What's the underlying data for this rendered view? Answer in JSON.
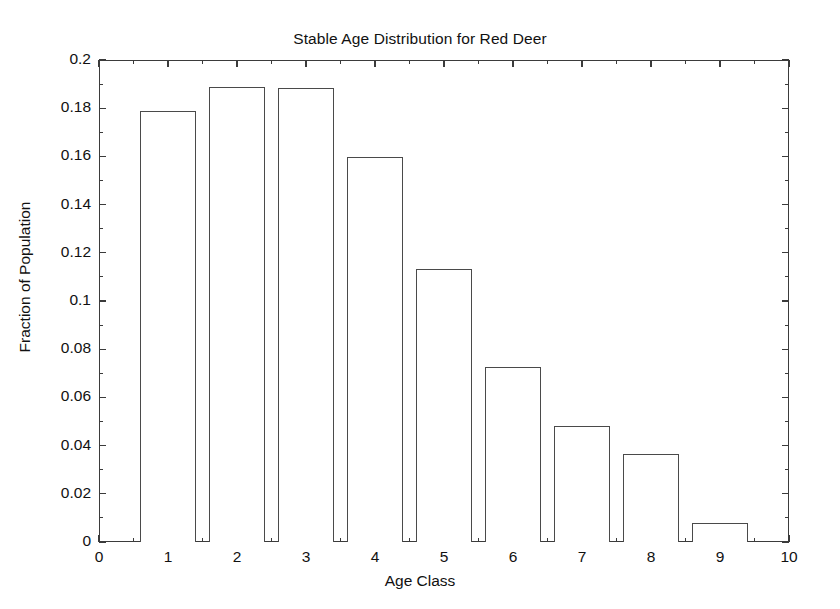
{
  "chart_data": {
    "type": "bar",
    "title": "Stable Age Distribution for Red Deer",
    "xlabel": "Age Class",
    "ylabel": "Fraction of Population",
    "categories": [
      "1",
      "2",
      "3",
      "4",
      "5",
      "6",
      "7",
      "8",
      "9"
    ],
    "x": [
      1,
      2,
      3,
      4,
      5,
      6,
      7,
      8,
      9
    ],
    "values": [
      0.179,
      0.189,
      0.1885,
      0.1597,
      0.1132,
      0.0728,
      0.0481,
      0.0366,
      0.0079
    ],
    "xlim": [
      0,
      10
    ],
    "ylim": [
      0,
      0.2
    ],
    "xticks": [
      "0",
      "1",
      "2",
      "3",
      "4",
      "5",
      "6",
      "7",
      "8",
      "9",
      "10"
    ],
    "xtick_values": [
      0,
      1,
      2,
      3,
      4,
      5,
      6,
      7,
      8,
      9,
      10
    ],
    "yticks": [
      "0",
      "0.02",
      "0.04",
      "0.06",
      "0.08",
      "0.1",
      "0.12",
      "0.14",
      "0.16",
      "0.18",
      "0.2"
    ],
    "ytick_values": [
      0,
      0.02,
      0.04,
      0.06,
      0.08,
      0.1,
      0.12,
      0.14,
      0.16,
      0.18,
      0.2
    ],
    "bar_width": 0.8,
    "grid": false,
    "legend": null,
    "bar_face_color": "#ffffff",
    "bar_edge_color": "#4a4a4a",
    "axis_color": "#3b3b3b",
    "background_color": "#ffffff"
  }
}
